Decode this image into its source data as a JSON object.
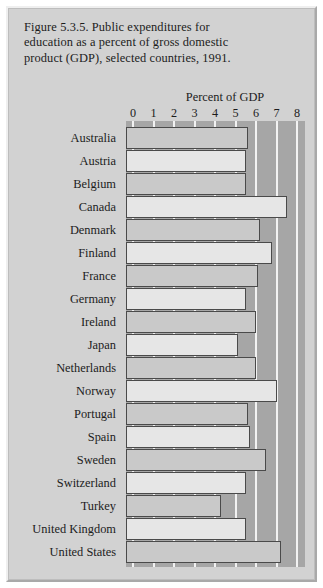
{
  "figure": {
    "caption_lines": [
      "Figure 5.3.5. Public expenditures for",
      "education as a percent of gross domestic",
      "product (GDP), selected countries, 1991."
    ],
    "axis_title": "Percent of GDP"
  },
  "chart_data": {
    "type": "bar",
    "orientation": "horizontal",
    "title": "Figure 5.3.5. Public expenditures for education as a percent of gross domestic product (GDP), selected countries, 1991.",
    "xlabel": "Percent of GDP",
    "ylabel": "",
    "xlim": [
      0,
      8
    ],
    "xticks": [
      "0",
      "1",
      "2",
      "3",
      "4",
      "5",
      "6",
      "7",
      "8"
    ],
    "xtick_values": [
      0,
      1,
      2,
      3,
      4,
      5,
      6,
      7,
      8
    ],
    "grid": true,
    "legend": false,
    "categories": [
      "Australia",
      "Austria",
      "Belgium",
      "Canada",
      "Denmark",
      "Finland",
      "France",
      "Germany",
      "Ireland",
      "Japan",
      "Netherlands",
      "Norway",
      "Portugal",
      "Spain",
      "Sweden",
      "Switzerland",
      "Turkey",
      "United Kingdom",
      "United States"
    ],
    "values": [
      5.6,
      5.5,
      5.5,
      7.5,
      6.2,
      6.8,
      6.1,
      5.5,
      6.0,
      5.1,
      6.0,
      7.0,
      5.6,
      5.7,
      6.5,
      5.5,
      4.3,
      5.5,
      7.2
    ],
    "bar_shades": [
      "mid",
      "light",
      "mid",
      "light",
      "mid",
      "light",
      "mid",
      "light",
      "mid",
      "light",
      "mid",
      "light",
      "mid",
      "light",
      "mid",
      "light",
      "mid",
      "light",
      "mid"
    ],
    "colors": {
      "plot_background": "#a6a6a6",
      "figure_background": "#d2d2d2",
      "bar_light": "#e6e6e6",
      "bar_mid": "#c9c9c9",
      "bar_outline": "#4a4a4a",
      "gridline": "#f2f2f2",
      "text": "#1c1c1c"
    }
  }
}
